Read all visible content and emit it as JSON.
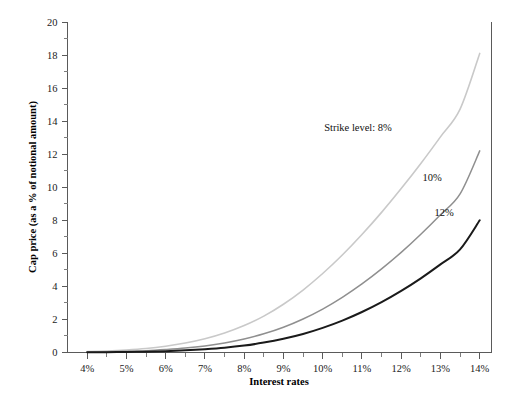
{
  "chart_data": {
    "type": "line",
    "title": "",
    "xlabel": "Interest rates",
    "ylabel": "Cap price (as a % of notional amount)",
    "xlim": [
      3.5,
      14.3
    ],
    "ylim": [
      0,
      20
    ],
    "grid": false,
    "legend_position": "inline-annotations",
    "x_tick_labels": [
      "4%",
      "5%",
      "6%",
      "7%",
      "8%",
      "9%",
      "10%",
      "11%",
      "12%",
      "13%",
      "14%"
    ],
    "x_tick_values": [
      4,
      5,
      6,
      7,
      8,
      9,
      10,
      11,
      12,
      13,
      14
    ],
    "x_minor_tick_values": [
      4.5,
      5.5,
      6.5,
      7.5,
      8.5,
      9.5,
      10.5,
      11.5,
      12.5,
      13.5
    ],
    "y_tick_labels": [
      "0",
      "2",
      "4",
      "6",
      "8",
      "10",
      "12",
      "14",
      "16",
      "18",
      "20"
    ],
    "y_tick_values": [
      0,
      2,
      4,
      6,
      8,
      10,
      12,
      14,
      16,
      18,
      20
    ],
    "y_minor_tick_values": [
      1,
      3,
      5,
      7,
      9,
      11,
      13,
      15,
      17,
      19
    ],
    "x": [
      4,
      4.5,
      5,
      5.5,
      6,
      6.5,
      7,
      7.5,
      8,
      8.5,
      9,
      9.5,
      10,
      10.5,
      11,
      11.5,
      12,
      12.5,
      13,
      13.5,
      14
    ],
    "series": [
      {
        "name": "Strike level: 8%",
        "annotation": "Strike level: 8%",
        "color": "#c9c9c9",
        "width": 1.6,
        "values": [
          0.05,
          0.09,
          0.15,
          0.24,
          0.38,
          0.57,
          0.83,
          1.18,
          1.63,
          2.2,
          2.92,
          3.78,
          4.78,
          5.9,
          7.14,
          8.48,
          9.92,
          11.44,
          13.05,
          14.73,
          18.1
        ]
      },
      {
        "name": "10%",
        "annotation": "10%",
        "color": "#8f8f8f",
        "width": 1.5,
        "values": [
          0.02,
          0.04,
          0.07,
          0.11,
          0.18,
          0.27,
          0.4,
          0.58,
          0.82,
          1.13,
          1.53,
          2.03,
          2.63,
          3.34,
          4.15,
          5.06,
          6.06,
          7.16,
          8.34,
          9.6,
          12.2
        ]
      },
      {
        "name": "12%",
        "annotation": "12%",
        "color": "#1a1a1a",
        "width": 2.0,
        "values": [
          0.01,
          0.02,
          0.03,
          0.05,
          0.08,
          0.13,
          0.2,
          0.29,
          0.42,
          0.6,
          0.83,
          1.12,
          1.49,
          1.93,
          2.45,
          3.05,
          3.73,
          4.49,
          5.33,
          6.24,
          8.0
        ]
      }
    ],
    "annotations": [
      {
        "text": "Strike level: 8%",
        "x_px": 358,
        "y_px": 131
      },
      {
        "text": "10%",
        "x_px": 432,
        "y_px": 181
      },
      {
        "text": "12%",
        "x_px": 444,
        "y_px": 216
      }
    ]
  },
  "axes": {
    "x_title": "Interest rates",
    "y_title": "Cap price (as a % of notional amount)"
  }
}
